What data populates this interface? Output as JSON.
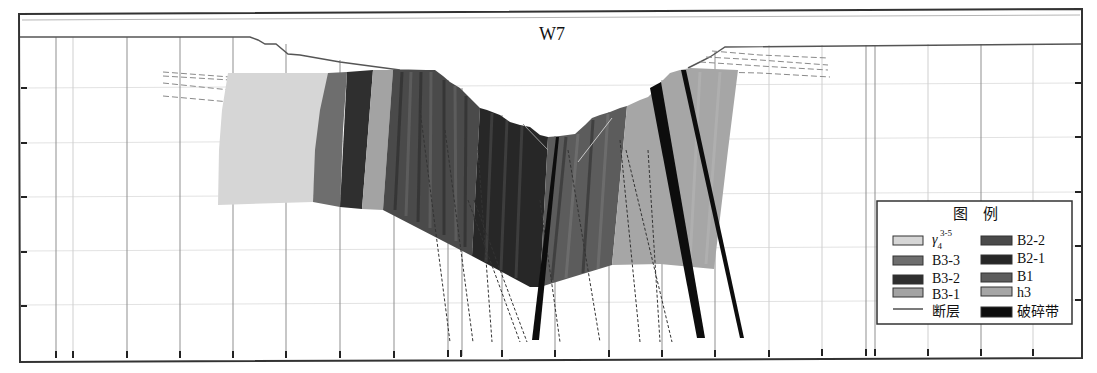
{
  "figure": {
    "title": "W7",
    "frame_color": "#333333",
    "ground_line_color": "#555555"
  },
  "legend": {
    "title": "图　例",
    "items": [
      {
        "id": "gamma4",
        "symbol": "γ",
        "sub": "4",
        "sup": "3-5",
        "color": "#d6d6d6"
      },
      {
        "id": "B3-3",
        "label": "B3-3",
        "color": "#6e6e6e"
      },
      {
        "id": "B3-2",
        "label": "B3-2",
        "color": "#2f2f2f"
      },
      {
        "id": "B3-1",
        "label": "B3-1",
        "color": "#a3a3a3"
      },
      {
        "id": "fault",
        "label": "断层",
        "color": "#333333",
        "type": "line"
      },
      {
        "id": "B2-2",
        "label": "B2-2",
        "color": "#4a4a4a"
      },
      {
        "id": "B2-1",
        "label": "B2-1",
        "color": "#272727"
      },
      {
        "id": "B1",
        "label": "B1",
        "color": "#5c5c5c"
      },
      {
        "id": "h3",
        "label": "h3",
        "color": "#a6a6a6"
      },
      {
        "id": "fracture-zone",
        "label": "破碎带",
        "color": "#0d0d0d"
      }
    ]
  }
}
